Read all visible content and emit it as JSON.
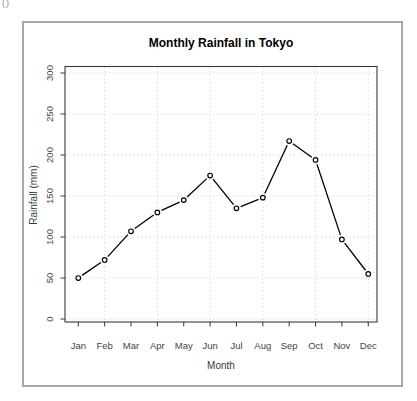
{
  "window": {
    "corner_text": "()"
  },
  "chart_data": {
    "type": "line",
    "title": "Monthly Rainfall in Tokyo",
    "xlabel": "Month",
    "ylabel": "Rainfall (mm)",
    "categories": [
      "Jan",
      "Feb",
      "Mar",
      "Apr",
      "May",
      "Jun",
      "Jul",
      "Aug",
      "Sep",
      "Oct",
      "Nov",
      "Dec"
    ],
    "values": [
      50,
      72,
      107,
      130,
      145,
      175,
      135,
      148,
      217,
      194,
      97,
      55
    ],
    "ylim": [
      0,
      300
    ],
    "y_ticks": [
      0,
      50,
      100,
      150,
      200,
      250,
      300
    ],
    "x_gridlines_at_categories": [
      "Feb",
      "Apr",
      "Jun",
      "Aug",
      "Oct",
      "Dec"
    ],
    "grid": true,
    "grid_style": "dotted",
    "legend": "none",
    "marker": "open-circle",
    "series_color": "#000000",
    "marker_fill": "#ffffff",
    "grid_color": "#dadada",
    "axis_color": "#383838",
    "tick_label_color": "#454545",
    "frame_color": "#a8a8a8",
    "background": "#ffffff"
  }
}
